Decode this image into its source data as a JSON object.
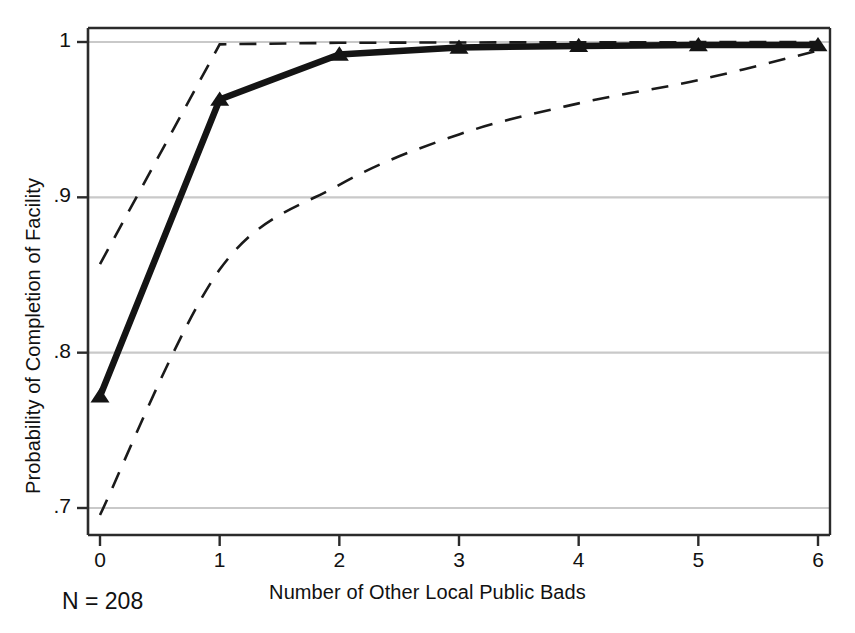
{
  "chart_data": {
    "type": "line",
    "title": "",
    "subtitle": "",
    "xlabel": "Number of Other Local Public Bads",
    "ylabel": "Probability of Completion of Facility",
    "xlim": [
      -0.1,
      6.1
    ],
    "ylim": [
      0.68,
      1.015
    ],
    "xticks": [
      0,
      1,
      2,
      3,
      4,
      5,
      6
    ],
    "xtick_labels": [
      "0",
      "1",
      "2",
      "3",
      "4",
      "5",
      "6"
    ],
    "yticks": [
      0.7,
      0.8,
      0.9,
      1.0
    ],
    "ytick_labels": [
      ".7",
      ".8",
      ".9",
      "1"
    ],
    "grid": "horizontal",
    "legend": "none",
    "x": [
      0,
      1,
      2,
      3,
      4,
      5,
      6
    ],
    "series": [
      {
        "name": "Predicted probability",
        "style": "solid",
        "marker": "triangle",
        "color": "#141414",
        "values": [
          0.772,
          0.963,
          0.992,
          0.9965,
          0.9975,
          0.998,
          0.998
        ]
      },
      {
        "name": "Upper confidence bound",
        "style": "dashed",
        "marker": "none",
        "color": "#1a1a1a",
        "values": [
          0.857,
          0.9985,
          0.9995,
          0.9997,
          0.9998,
          0.9999,
          0.9999
        ]
      },
      {
        "name": "Lower confidence bound",
        "style": "dashed",
        "marker": "none",
        "color": "#1a1a1a",
        "values": [
          0.6955,
          0.8535,
          0.908,
          0.9405,
          0.9605,
          0.9755,
          0.9945
        ]
      }
    ],
    "annotations": [
      {
        "name": "sample-size",
        "text": "N = 208",
        "x": 0.1,
        "y": 0.648
      }
    ]
  },
  "axis": {
    "y_title": "Probability of Completion of Facility",
    "x_title": "Number of Other Local Public Bads"
  },
  "colors": {
    "line": "#141414",
    "grid": "#c9c9c9",
    "frame": "#2b2b2b",
    "background": "#ffffff",
    "text": "#111111"
  },
  "annotation": {
    "sample_size": "N = 208"
  }
}
